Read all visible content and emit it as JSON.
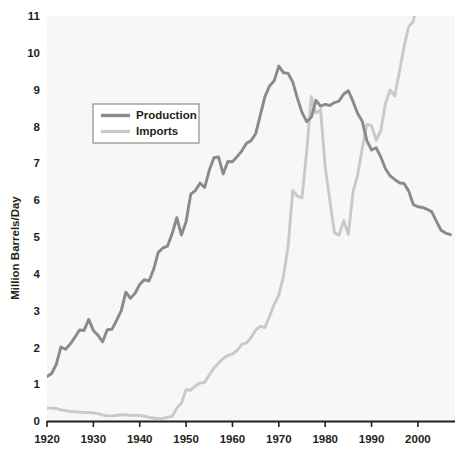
{
  "chart_data": {
    "type": "line",
    "title": "",
    "subtitle": "",
    "xlabel": "",
    "ylabel": "Million Barrels/Day",
    "xlim": [
      1920,
      2008
    ],
    "ylim": [
      0,
      11
    ],
    "grid": false,
    "legend_position": "upper-left-inside",
    "x_ticks": [
      1920,
      1930,
      1940,
      1950,
      1960,
      1970,
      1980,
      1990,
      2000
    ],
    "x_tick_labels": [
      "1920",
      "1930",
      "1940",
      "1950",
      "1960",
      "1970",
      "1980",
      "1990",
      "2000"
    ],
    "y_ticks": [
      0,
      1,
      2,
      3,
      4,
      5,
      6,
      7,
      8,
      9,
      10,
      11
    ],
    "y_tick_labels": [
      "0",
      "1",
      "2",
      "3",
      "4",
      "5",
      "6",
      "7",
      "8",
      "9",
      "10",
      "11"
    ],
    "colors": {
      "production": "#8a8a8a",
      "imports": "#c9c9c9",
      "axis": "#231f20",
      "plot_background": "#f7f7f5",
      "page_background": "#ffffff",
      "legend_border": "#8c8c8c",
      "text": "#231f20"
    },
    "series": [
      {
        "name": "Production",
        "color": "#8a8a8a",
        "x": [
          1920,
          1921,
          1922,
          1923,
          1924,
          1925,
          1926,
          1927,
          1928,
          1929,
          1930,
          1931,
          1932,
          1933,
          1934,
          1935,
          1936,
          1937,
          1938,
          1939,
          1940,
          1941,
          1942,
          1943,
          1944,
          1945,
          1946,
          1947,
          1948,
          1949,
          1950,
          1951,
          1952,
          1953,
          1954,
          1955,
          1956,
          1957,
          1958,
          1959,
          1960,
          1961,
          1962,
          1963,
          1964,
          1965,
          1966,
          1967,
          1968,
          1969,
          1970,
          1971,
          1972,
          1973,
          1974,
          1975,
          1976,
          1977,
          1978,
          1979,
          1980,
          1981,
          1982,
          1983,
          1984,
          1985,
          1986,
          1987,
          1988,
          1989,
          1990,
          1991,
          1992,
          1993,
          1994,
          1995,
          1996,
          1997,
          1998,
          1999,
          2000,
          2001,
          2002,
          2003,
          2004,
          2005,
          2006,
          2007
        ],
        "values": [
          1.21,
          1.29,
          1.54,
          2.01,
          1.95,
          2.09,
          2.27,
          2.47,
          2.46,
          2.76,
          2.46,
          2.33,
          2.15,
          2.48,
          2.49,
          2.73,
          2.99,
          3.5,
          3.33,
          3.47,
          3.71,
          3.84,
          3.8,
          4.12,
          4.58,
          4.7,
          4.75,
          5.09,
          5.52,
          5.05,
          5.41,
          6.16,
          6.26,
          6.46,
          6.34,
          6.81,
          7.15,
          7.17,
          6.71,
          7.05,
          7.04,
          7.18,
          7.33,
          7.54,
          7.61,
          7.8,
          8.3,
          8.81,
          9.1,
          9.24,
          9.64,
          9.46,
          9.44,
          9.21,
          8.77,
          8.38,
          8.13,
          8.25,
          8.71,
          8.55,
          8.6,
          8.57,
          8.65,
          8.69,
          8.88,
          8.97,
          8.68,
          8.35,
          8.14,
          7.61,
          7.36,
          7.42,
          7.17,
          6.85,
          6.66,
          6.56,
          6.47,
          6.45,
          6.25,
          5.88,
          5.82,
          5.8,
          5.75,
          5.68,
          5.42,
          5.18,
          5.1,
          5.06
        ]
      },
      {
        "name": "Imports",
        "color": "#c9c9c9",
        "x": [
          1920,
          1921,
          1922,
          1923,
          1924,
          1925,
          1926,
          1927,
          1928,
          1929,
          1930,
          1931,
          1932,
          1933,
          1934,
          1935,
          1936,
          1937,
          1938,
          1939,
          1940,
          1941,
          1942,
          1943,
          1944,
          1945,
          1946,
          1947,
          1948,
          1949,
          1950,
          1951,
          1952,
          1953,
          1954,
          1955,
          1956,
          1957,
          1958,
          1959,
          1960,
          1961,
          1962,
          1963,
          1964,
          1965,
          1966,
          1967,
          1968,
          1969,
          1970,
          1971,
          1972,
          1973,
          1974,
          1975,
          1976,
          1977,
          1978,
          1979,
          1980,
          1981,
          1982,
          1983,
          1984,
          1985,
          1986,
          1987,
          1988,
          1989,
          1990,
          1991,
          1992,
          1993,
          1994,
          1995,
          1996,
          1997,
          1998,
          1999,
          2000,
          2001,
          2002,
          2003,
          2004,
          2005,
          2006,
          2007
        ],
        "values": [
          0.35,
          0.35,
          0.34,
          0.3,
          0.28,
          0.26,
          0.25,
          0.24,
          0.23,
          0.23,
          0.22,
          0.2,
          0.16,
          0.14,
          0.14,
          0.15,
          0.17,
          0.17,
          0.15,
          0.16,
          0.15,
          0.13,
          0.1,
          0.08,
          0.06,
          0.07,
          0.1,
          0.13,
          0.35,
          0.49,
          0.85,
          0.84,
          0.95,
          1.03,
          1.05,
          1.25,
          1.44,
          1.57,
          1.7,
          1.78,
          1.82,
          1.92,
          2.08,
          2.12,
          2.26,
          2.47,
          2.57,
          2.54,
          2.84,
          3.17,
          3.42,
          3.93,
          4.74,
          6.26,
          6.11,
          6.06,
          7.31,
          8.81,
          8.36,
          8.46,
          6.91,
          6.0,
          5.11,
          5.05,
          5.44,
          5.07,
          6.22,
          6.68,
          7.4,
          8.06,
          8.02,
          7.63,
          7.89,
          8.62,
          8.99,
          8.83,
          9.48,
          10.16,
          10.71,
          10.85,
          11.46,
          11.87,
          11.53,
          12.26,
          13.15,
          13.71,
          13.71,
          13.47
        ]
      }
    ],
    "series_note": "Imports values above chart range are clipped at plot top"
  },
  "legend": {
    "entries": [
      {
        "label": "Production",
        "color": "#8a8a8a"
      },
      {
        "label": "Imports",
        "color": "#c9c9c9"
      }
    ]
  },
  "axes": {
    "y_title": "Million Barrels/Day"
  }
}
